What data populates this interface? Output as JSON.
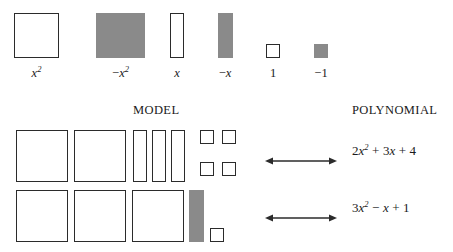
{
  "figure": {
    "colors": {
      "ink": "#2b2b2b",
      "gray_fill": "#8a8a8a",
      "background": "#ffffff"
    },
    "legend": {
      "items": [
        {
          "label": "x²",
          "base": "x",
          "exponent": "2",
          "sign": "",
          "fill": "white",
          "shape": "large-square",
          "name": "x-squared"
        },
        {
          "label": "−x²",
          "base": "x",
          "exponent": "2",
          "sign": "−",
          "fill": "gray",
          "shape": "large-square",
          "name": "negative-x-squared"
        },
        {
          "label": "x",
          "base": "x",
          "exponent": "",
          "sign": "",
          "fill": "white",
          "shape": "tall-rectangle",
          "name": "x"
        },
        {
          "label": "−x",
          "base": "x",
          "exponent": "",
          "sign": "−",
          "fill": "gray",
          "shape": "tall-rectangle",
          "name": "negative-x"
        },
        {
          "label": "1",
          "base": "1",
          "exponent": "",
          "sign": "",
          "fill": "white",
          "shape": "unit-square",
          "name": "one"
        },
        {
          "label": "−1",
          "base": "1",
          "exponent": "",
          "sign": "−",
          "fill": "gray",
          "shape": "unit-square",
          "name": "negative-one"
        }
      ]
    },
    "headings": {
      "model": "MODEL",
      "polynomial": "POLYNOMIAL"
    },
    "rows": [
      {
        "model_counts": {
          "large_white_squares": 2,
          "tall_white_rectangles": 3,
          "unit_white_squares": 4,
          "gray_tall_rectangles": 0,
          "gray_unit_squares": 0
        },
        "arrow": "double-headed-arrow",
        "polynomial": {
          "full": "2x² + 3x + 4",
          "terms": [
            {
              "coefficient": "2",
              "variable": "x",
              "exponent": "2"
            },
            {
              "operator": "+",
              "coefficient": "3",
              "variable": "x",
              "exponent": ""
            },
            {
              "operator": "+",
              "coefficient": "4",
              "variable": "",
              "exponent": ""
            }
          ]
        }
      },
      {
        "model_counts": {
          "large_white_squares": 3,
          "tall_white_rectangles": 0,
          "unit_white_squares": 1,
          "gray_tall_rectangles": 1,
          "gray_unit_squares": 0
        },
        "arrow": "double-headed-arrow",
        "polynomial": {
          "full": "3x² − x + 1",
          "terms": [
            {
              "coefficient": "3",
              "variable": "x",
              "exponent": "2"
            },
            {
              "operator": "−",
              "coefficient": "",
              "variable": "x",
              "exponent": ""
            },
            {
              "operator": "+",
              "coefficient": "1",
              "variable": "",
              "exponent": ""
            }
          ]
        }
      }
    ]
  }
}
